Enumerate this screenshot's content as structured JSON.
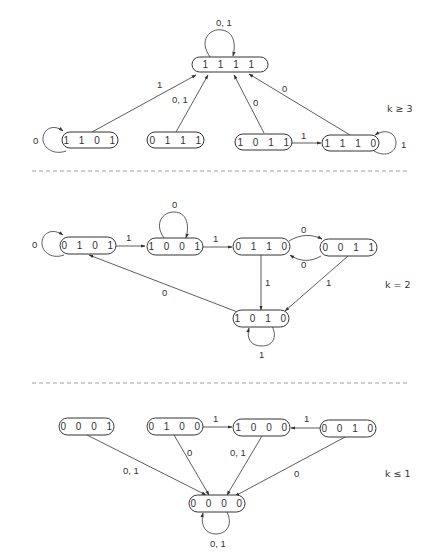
{
  "diagram": {
    "type": "state-transition-diagram",
    "sections": [
      {
        "condition_label": "k ≥ 3",
        "nodes": [
          {
            "id": "n1111",
            "label": "1 1 1 1"
          },
          {
            "id": "n1101",
            "label": "1 1 0 1"
          },
          {
            "id": "n0111",
            "label": "0 1 1 1"
          },
          {
            "id": "n1011",
            "label": "1 0 1 1"
          },
          {
            "id": "n1110",
            "label": "1 1 1 0"
          }
        ],
        "edges": [
          {
            "from": "1111",
            "to": "1111",
            "label": "0, 1"
          },
          {
            "from": "1101",
            "to": "1111",
            "label": "1"
          },
          {
            "from": "1101",
            "to": "1101",
            "label": "0"
          },
          {
            "from": "0111",
            "to": "1111",
            "label": "0, 1"
          },
          {
            "from": "1011",
            "to": "1111",
            "label": "0"
          },
          {
            "from": "1011",
            "to": "1110",
            "label": "1"
          },
          {
            "from": "1110",
            "to": "1111",
            "label": "0"
          },
          {
            "from": "1110",
            "to": "1110",
            "label": "1"
          }
        ]
      },
      {
        "condition_label": "k = 2",
        "nodes": [
          {
            "id": "n0101",
            "label": "0 1 0 1"
          },
          {
            "id": "n1001",
            "label": "1 0 0 1"
          },
          {
            "id": "n0110",
            "label": "0 1 1 0"
          },
          {
            "id": "n0011",
            "label": "0 0 1 1"
          },
          {
            "id": "n1010",
            "label": "1 0 1 0"
          }
        ],
        "edges": [
          {
            "from": "0101",
            "to": "0101",
            "label": "0"
          },
          {
            "from": "0101",
            "to": "1001",
            "label": "1"
          },
          {
            "from": "1001",
            "to": "1001",
            "label": "0"
          },
          {
            "from": "1001",
            "to": "0110",
            "label": "1"
          },
          {
            "from": "0110",
            "to": "0011",
            "label": "0"
          },
          {
            "from": "0011",
            "to": "0110",
            "label": "0"
          },
          {
            "from": "0110",
            "to": "1010",
            "label": "1"
          },
          {
            "from": "0011",
            "to": "1010",
            "label": "1"
          },
          {
            "from": "1010",
            "to": "0101",
            "label": "0"
          },
          {
            "from": "1010",
            "to": "1010",
            "label": "1"
          }
        ]
      },
      {
        "condition_label": "k ≤ 1",
        "nodes": [
          {
            "id": "n0001",
            "label": "0 0 0 1"
          },
          {
            "id": "n0100",
            "label": "0 1 0 0"
          },
          {
            "id": "n1000",
            "label": "1 0 0 0"
          },
          {
            "id": "n0010",
            "label": "0 0 1 0"
          },
          {
            "id": "n0000",
            "label": "0 0 0 0"
          }
        ],
        "edges": [
          {
            "from": "0001",
            "to": "0000",
            "label": "0, 1"
          },
          {
            "from": "0100",
            "to": "1000",
            "label": "1"
          },
          {
            "from": "0100",
            "to": "0000",
            "label": "0"
          },
          {
            "from": "1000",
            "to": "0000",
            "label": "0, 1"
          },
          {
            "from": "0010",
            "to": "1000",
            "label": "1"
          },
          {
            "from": "0010",
            "to": "0000",
            "label": "0"
          },
          {
            "from": "0000",
            "to": "0000",
            "label": "0, 1"
          }
        ]
      }
    ]
  },
  "labels": {
    "s1": {
      "k": "k ≥ 3",
      "n1111": "1 1 1 1",
      "n1101": "1 1 0 1",
      "n0111": "0 1 1 1",
      "n1011": "1 0 1 1",
      "n1110": "1 1 1 0",
      "e_1111_self": "0, 1",
      "e_1101_1111": "1",
      "e_1101_self": "0",
      "e_0111_1111": "0, 1",
      "e_1011_1111": "0",
      "e_1011_1110": "1",
      "e_1110_1111": "0",
      "e_1110_self": "1"
    },
    "s2": {
      "k": "k = 2",
      "n0101": "0 1 0 1",
      "n1001": "1 0 0 1",
      "n0110": "0 1 1 0",
      "n0011": "0 0 1 1",
      "n1010": "1 0 1 0",
      "e_0101_self": "0",
      "e_0101_1001": "1",
      "e_1001_self": "0",
      "e_1001_0110": "1",
      "e_0110_0011": "0",
      "e_0011_0110": "0",
      "e_0110_1010": "1",
      "e_0011_1010": "1",
      "e_1010_0101": "0",
      "e_1010_self": "1"
    },
    "s3": {
      "k": "k ≤ 1",
      "n0001": "0 0 0 1",
      "n0100": "0 1 0 0",
      "n1000": "1 0 0 0",
      "n0010": "0 0 1 0",
      "n0000": "0 0 0 0",
      "e_0001_0000": "0, 1",
      "e_0100_1000": "1",
      "e_0100_0000": "0",
      "e_1000_0000": "0, 1",
      "e_0010_1000": "1",
      "e_0010_0000": "0",
      "e_0000_self": "0, 1"
    }
  },
  "colors": {
    "line": "#333333",
    "separator": "#888888",
    "background": "#ffffff"
  }
}
